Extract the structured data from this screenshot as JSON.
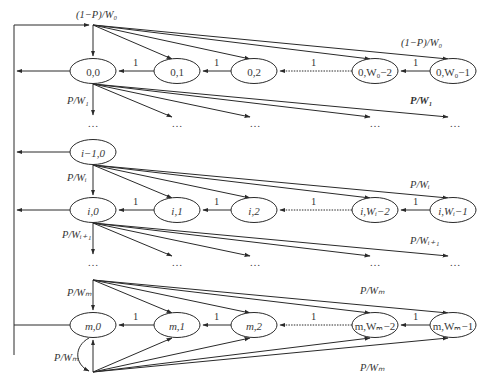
{
  "colors": {
    "stroke": "#2a2a2a",
    "text": "#3a3a3a",
    "background": "#ffffff"
  },
  "rows": [
    {
      "id": "stage-0",
      "nodes": [
        {
          "label": "0,0",
          "x": 93,
          "y": 71
        },
        {
          "label": "0,1",
          "x": 177,
          "y": 71
        },
        {
          "label": "0,2",
          "x": 254,
          "y": 71
        },
        {
          "label": "0,W₀−2",
          "x": 375,
          "y": 71
        },
        {
          "label": "0,W₀−1",
          "x": 453,
          "y": 71
        }
      ],
      "chain_labels": [
        "1",
        "1",
        "1",
        "1"
      ],
      "entry_label": "(1−P)/W₀",
      "entry_label_right": "(1−P)/W₀",
      "exit_label": "P/W₁",
      "exit_label_right": "P/W₁"
    },
    {
      "id": "stage-i-minus-1",
      "nodes": [
        {
          "label": "i−1,0",
          "x": 93,
          "y": 152
        }
      ]
    },
    {
      "id": "stage-i",
      "nodes": [
        {
          "label": "i,0",
          "x": 93,
          "y": 210
        },
        {
          "label": "i,1",
          "x": 177,
          "y": 210
        },
        {
          "label": "i,2",
          "x": 254,
          "y": 210
        },
        {
          "label": "i,Wᵢ−2",
          "x": 375,
          "y": 210
        },
        {
          "label": "i,Wᵢ−1",
          "x": 453,
          "y": 210
        }
      ],
      "chain_labels": [
        "1",
        "1",
        "1",
        "1"
      ],
      "entry_label": "P/Wᵢ",
      "entry_label_right": "P/Wᵢ",
      "exit_label": "P/Wᵢ₊₁",
      "exit_label_right": "P/Wᵢ₊₁"
    },
    {
      "id": "stage-m",
      "nodes": [
        {
          "label": "m,0",
          "x": 93,
          "y": 325
        },
        {
          "label": "m,1",
          "x": 177,
          "y": 325
        },
        {
          "label": "m,2",
          "x": 254,
          "y": 325
        },
        {
          "label": "m,Wₘ−2",
          "x": 375,
          "y": 325
        },
        {
          "label": "m,Wₘ−1",
          "x": 453,
          "y": 325
        }
      ],
      "chain_labels": [
        "1",
        "1",
        "1",
        "1"
      ],
      "entry_label": "P/Wₘ",
      "entry_label_right": "P/Wₘ",
      "loop_label": "P/Wₘ",
      "bottom_label_right": "P/Wₘ"
    }
  ],
  "ellipsis": "…"
}
